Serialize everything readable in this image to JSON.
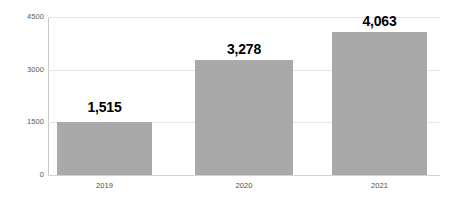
{
  "chart_data": {
    "type": "bar",
    "title": "",
    "subtitle": "",
    "xlabel": "",
    "ylabel": "",
    "categories": [
      "2019",
      "2020",
      "2021"
    ],
    "values": [
      1515,
      3278,
      4063
    ],
    "value_labels": [
      "1,515",
      "3,278",
      "4,063"
    ],
    "series": [
      {
        "name": "",
        "values": [
          1515,
          3278,
          4063
        ]
      }
    ],
    "ylim": [
      0,
      4500
    ],
    "y_ticks": [
      0,
      1500,
      3000,
      4500
    ],
    "y_tick_labels": [
      "0",
      "1500",
      "3000",
      "4500"
    ],
    "grid": true,
    "legend": false,
    "legend_position": "none",
    "bar_color": "#a9a9a9",
    "gridline_color": "#e6e6e6",
    "axis_color": "#c8c8c8",
    "value_label_color": "#000000",
    "tick_label_color": "#595959"
  }
}
